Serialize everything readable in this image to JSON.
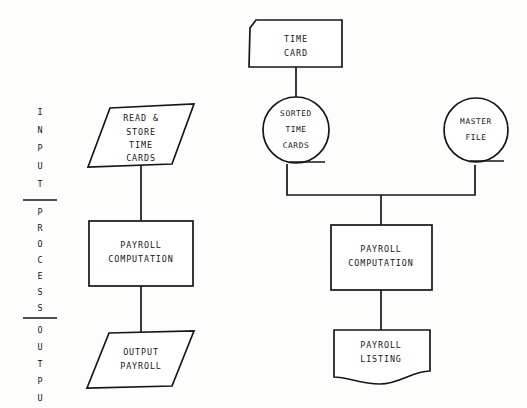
{
  "diagram": {
    "background_color": "#fdfdfc",
    "line_color": "#15161a",
    "shape_fill": "#ffffff",
    "bands": [
      {
        "name": "input",
        "label": "INPUT",
        "letters": [
          "I",
          "N",
          "P",
          "U",
          "T"
        ]
      },
      {
        "name": "process",
        "label": "PROCESS",
        "letters": [
          "P",
          "R",
          "O",
          "C",
          "E",
          "S",
          "S"
        ]
      },
      {
        "name": "output",
        "label": "OUTPUT",
        "letters": [
          "O",
          "U",
          "T",
          "P",
          "U",
          "T"
        ]
      }
    ],
    "left_column": {
      "name": "manual-payroll-flow",
      "nodes": [
        {
          "id": "read-store-time-cards",
          "shape": "parallelogram",
          "shape_meaning": "input-output",
          "lines": [
            "READ &",
            "STORE",
            "TIME",
            "CARDS"
          ]
        },
        {
          "id": "payroll-computation-left",
          "shape": "rectangle",
          "shape_meaning": "process",
          "lines": [
            "PAYROLL",
            "COMPUTATION"
          ]
        },
        {
          "id": "output-payroll",
          "shape": "parallelogram",
          "shape_meaning": "input-output",
          "lines": [
            "OUTPUT",
            "PAYROLL"
          ]
        }
      ]
    },
    "right_column": {
      "name": "automated-payroll-flow",
      "nodes": [
        {
          "id": "time-card",
          "shape": "punched-card",
          "shape_meaning": "punched-card",
          "lines": [
            "TIME",
            "CARD"
          ]
        },
        {
          "id": "sorted-time-cards",
          "shape": "circle",
          "shape_meaning": "magnetic-tape",
          "lines": [
            "SORTED",
            "TIME",
            "CARDS"
          ]
        },
        {
          "id": "master-file",
          "shape": "circle",
          "shape_meaning": "magnetic-tape",
          "lines": [
            "MASTER",
            "FILE"
          ]
        },
        {
          "id": "payroll-computation-right",
          "shape": "rectangle",
          "shape_meaning": "process",
          "lines": [
            "PAYROLL",
            "COMPUTATION"
          ]
        },
        {
          "id": "payroll-listing",
          "shape": "document",
          "shape_meaning": "document",
          "lines": [
            "PAYROLL",
            "LISTING"
          ]
        }
      ]
    }
  }
}
